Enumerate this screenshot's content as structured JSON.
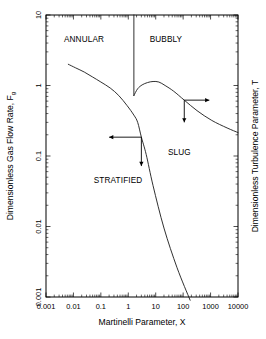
{
  "chart_data": {
    "type": "line",
    "title": "",
    "xlabel": "Martinelli Parameter, X",
    "ylabel": "Dimensionless Gas Flow Rate, F",
    "ylabel_sub": "g",
    "y2label": "Dimensionless Turbulence Parameter, T",
    "xscale": "log",
    "yscale": "log",
    "xlim": [
      0.001,
      10000
    ],
    "ylim": [
      0.001,
      10
    ],
    "grid": false,
    "legend": null,
    "xticks": [
      "0.001",
      "0.01",
      "0.1",
      "1",
      "10",
      "100",
      "1000",
      "10000"
    ],
    "xtick_values": [
      0.001,
      0.01,
      0.1,
      1,
      10,
      100,
      1000,
      10000
    ],
    "yticks": [
      "0.001",
      "0.01",
      "0.1",
      "1",
      "10"
    ],
    "ytick_values": [
      0.001,
      0.01,
      0.1,
      1,
      10
    ],
    "annotations": [
      {
        "name": "annular",
        "text": "ANNULAR",
        "x": 0.0045,
        "y": 4.2
      },
      {
        "name": "bubbly",
        "text": "BUBBLY",
        "x": 6.0,
        "y": 4.2
      },
      {
        "name": "slug",
        "text": "SLUG",
        "x": 28.0,
        "y": 0.105
      },
      {
        "name": "stratified",
        "text": "STRATIFIED",
        "x": 0.055,
        "y": 0.042
      }
    ],
    "series": [
      {
        "name": "annular-transition",
        "comment": "F_g boundary separating ANNULAR from STRATIFIED/SLUG; descends from upper-left",
        "points": [
          [
            0.0065,
            2.0
          ],
          [
            0.012,
            1.78
          ],
          [
            0.025,
            1.55
          ],
          [
            0.05,
            1.32
          ],
          [
            0.1,
            1.12
          ],
          [
            0.22,
            0.92
          ],
          [
            0.45,
            0.72
          ],
          [
            0.9,
            0.52
          ],
          [
            1.6,
            0.38
          ],
          [
            2.2,
            0.3
          ],
          [
            3.0,
            0.185
          ],
          [
            4.5,
            0.105
          ],
          [
            8.0,
            0.038
          ],
          [
            20.0,
            0.0095
          ],
          [
            60.0,
            0.0026
          ],
          [
            180.0,
            0.0009
          ]
        ]
      },
      {
        "name": "bubbly-boundary",
        "comment": "vertical line at X ~ 1.6 from F = 10 down to F ~ 0.72",
        "points": [
          [
            1.6,
            10.0
          ],
          [
            1.6,
            0.72
          ]
        ]
      },
      {
        "name": "slug-bubbly-T-curve",
        "comment": "humped T-parameter curve rising then falling to the right edge",
        "points": [
          [
            1.6,
            0.72
          ],
          [
            2.2,
            0.9
          ],
          [
            3.2,
            1.02
          ],
          [
            5.0,
            1.1
          ],
          [
            8.0,
            1.14
          ],
          [
            13.0,
            1.12
          ],
          [
            22.0,
            1.0
          ],
          [
            45.0,
            0.83
          ],
          [
            110.0,
            0.62
          ],
          [
            320.0,
            0.44
          ],
          [
            1100.0,
            0.32
          ],
          [
            4000.0,
            0.25
          ],
          [
            10000.0,
            0.215
          ]
        ]
      }
    ],
    "arrows": [
      {
        "name": "arrow-left-annular",
        "direction": "left",
        "from_x": 3.0,
        "from_y": 0.185,
        "to_x": 0.2,
        "to_y": 0.185
      },
      {
        "name": "arrow-down-stratified",
        "direction": "down",
        "from_x": 3.0,
        "from_y": 0.185,
        "to_x": 3.0,
        "to_y": 0.072
      },
      {
        "name": "arrow-right-slug",
        "direction": "right",
        "from_x": 110.0,
        "from_y": 0.62,
        "to_x": 900.0,
        "to_y": 0.62
      },
      {
        "name": "arrow-down-slug",
        "direction": "down",
        "from_x": 110.0,
        "from_y": 0.62,
        "to_x": 110.0,
        "to_y": 0.3
      }
    ]
  }
}
